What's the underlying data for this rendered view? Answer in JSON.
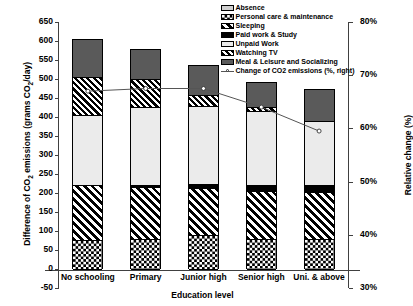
{
  "chart_data": {
    "type": "bar",
    "subtype": "stacked-bar-with-line",
    "title": "",
    "xlabel": "Education level",
    "ylabel": "Difference of CO2 emissions (grams CO2/day)",
    "ylabel_right": "Relative change (%)",
    "categories": [
      "No schooling",
      "Primary",
      "Junior high",
      "Senior high",
      "Uni. & above"
    ],
    "ylim": [
      -50,
      650
    ],
    "yticks": [
      -50,
      0,
      50,
      100,
      150,
      200,
      250,
      300,
      350,
      400,
      450,
      500,
      550,
      600,
      650
    ],
    "ylim_right": [
      30,
      80
    ],
    "yticks_right": [
      "30%",
      "40%",
      "50%",
      "60%",
      "70%",
      "80%"
    ],
    "grid": false,
    "legend_position": "top-right",
    "series": [
      {
        "name": "Personal care & maintenance",
        "pattern": "checkerboard",
        "values": [
          75,
          80,
          90,
          80,
          80
        ]
      },
      {
        "name": "Sleeping",
        "pattern": "diagonal-wide",
        "values": [
          145,
          135,
          122,
          125,
          122
        ]
      },
      {
        "name": "Paid work & Study",
        "pattern": "solid-black",
        "values": [
          0,
          5,
          12,
          17,
          20
        ]
      },
      {
        "name": "Unpaid Work",
        "pattern": "light-gray",
        "values": [
          185,
          205,
          205,
          193,
          168
        ]
      },
      {
        "name": "Watching TV",
        "pattern": "diagonal-narrow",
        "values": [
          100,
          75,
          30,
          12,
          0
        ]
      },
      {
        "name": "Meal & Leisure and Socializing",
        "pattern": "dark-gray",
        "values": [
          100,
          78,
          79,
          66,
          83
        ]
      },
      {
        "name": "Absence",
        "pattern": "pale-gray",
        "values": [
          0,
          0,
          0,
          0,
          0
        ]
      }
    ],
    "totals": [
      605,
      578,
      538,
      493,
      473
    ],
    "line_series": {
      "name": "Change of CO2 emissions (%, right)",
      "values": [
        67.0,
        67.5,
        67.5,
        64.0,
        59.5
      ],
      "axis": "right",
      "marker": "circle",
      "color": "#555555"
    }
  },
  "legend": {
    "items": [
      {
        "label": "Absence",
        "swatch": "pale-gray"
      },
      {
        "label": "Personal care & maintenance",
        "swatch": "checkerboard"
      },
      {
        "label": "Sleeping",
        "swatch": "diagonal-wide"
      },
      {
        "label": "Paid work & Study",
        "swatch": "solid-black"
      },
      {
        "label": "Unpaid Work",
        "swatch": "light-gray"
      },
      {
        "label": "Watching TV",
        "swatch": "diagonal-narrow"
      },
      {
        "label": "Meal & Leisure and Socializing",
        "swatch": "dark-gray"
      },
      {
        "label": "Change of CO2 emissions (%, right)",
        "swatch": "line-marker"
      }
    ]
  },
  "axes": {
    "left_title_parts": {
      "a": "Difference of CO",
      "sub": "2",
      "b": " emissions (grams CO",
      "sub2": "2",
      "c": "/day)"
    },
    "right_title": "Relative change (%)",
    "x_title": "Education level"
  },
  "colors": {
    "dark_gray": "#5a5a5a",
    "light_gray": "#ebebeb",
    "pale_gray": "#d0d0d0",
    "black": "#000000",
    "line": "#555555",
    "axis": "#404040"
  }
}
